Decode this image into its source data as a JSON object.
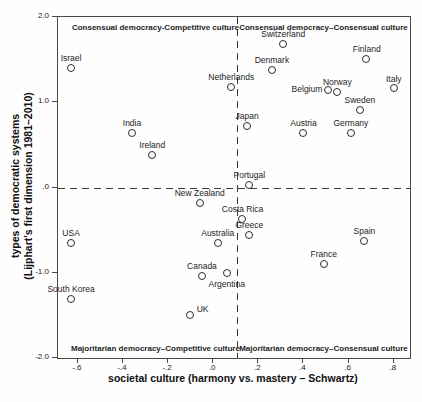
{
  "chart_data": {
    "type": "scatter",
    "title": "",
    "xlabel": "societal culture (harmony vs. mastery – Schwartz)",
    "ylabel_line1": "types of democratic systems",
    "ylabel_line2": "(Lijphart's first dimension 1981–2010)",
    "xlim": [
      -0.688,
      0.872
    ],
    "ylim": [
      -2.0,
      2.0
    ],
    "grid": false,
    "x_ticks": [
      {
        "value": -0.6,
        "label": "-.6"
      },
      {
        "value": -0.4,
        "label": "-.4"
      },
      {
        "value": -0.2,
        "label": "-.2"
      },
      {
        "value": 0.0,
        "label": ".0"
      },
      {
        "value": 0.2,
        "label": ".2"
      },
      {
        "value": 0.4,
        "label": ".4"
      },
      {
        "value": 0.6,
        "label": ".6"
      },
      {
        "value": 0.8,
        "label": ".8"
      }
    ],
    "y_ticks": [
      {
        "value": 2.0,
        "label": "2.0"
      },
      {
        "value": 1.0,
        "label": "1.0"
      },
      {
        "value": 0.0,
        "label": ".0"
      },
      {
        "value": -1.0,
        "label": "-1.0"
      },
      {
        "value": -2.0,
        "label": "-2.0"
      }
    ],
    "reference_lines": {
      "horizontal_y": 0.0,
      "vertical_x": 0.105,
      "style": "dashed",
      "color": "#3a3a3a"
    },
    "quadrant_labels": [
      {
        "id": "top-left",
        "text": "Consensual democracy-Competitive culture"
      },
      {
        "id": "top-right",
        "text": "Consensual democracy–Consensual culture"
      },
      {
        "id": "bottom-left",
        "text": "Majoritarian democracy–Competitive culture"
      },
      {
        "id": "bottom-right",
        "text": "Majoritarian democracy–Consensual culture"
      }
    ],
    "marker": {
      "shape": "open-circle",
      "color": "#2e2e2e",
      "size_px": 7
    },
    "colors": {
      "background": "#fefefe",
      "frame": "#4a4a4a",
      "text": "#1d1d1d"
    },
    "points": [
      {
        "country": "Israel",
        "x": -0.63,
        "y": 1.4,
        "label_pos": "above"
      },
      {
        "country": "Switzerland",
        "x": 0.31,
        "y": 1.68,
        "label_pos": "above"
      },
      {
        "country": "Finland",
        "x": 0.68,
        "y": 1.51,
        "label_pos": "above"
      },
      {
        "country": "Denmark",
        "x": 0.26,
        "y": 1.38,
        "label_pos": "above"
      },
      {
        "country": "Netherlands",
        "x": 0.08,
        "y": 1.18,
        "label_pos": "above"
      },
      {
        "country": "Italy",
        "x": 0.8,
        "y": 1.16,
        "label_pos": "above"
      },
      {
        "country": "Belgium",
        "x": 0.51,
        "y": 1.14,
        "label_pos": "left"
      },
      {
        "country": "Norway",
        "x": 0.55,
        "y": 1.12,
        "label_pos": "above"
      },
      {
        "country": "Sweden",
        "x": 0.65,
        "y": 0.91,
        "label_pos": "above"
      },
      {
        "country": "Japan",
        "x": 0.15,
        "y": 0.72,
        "label_pos": "above"
      },
      {
        "country": "Austria",
        "x": 0.4,
        "y": 0.64,
        "label_pos": "above"
      },
      {
        "country": "Germany",
        "x": 0.61,
        "y": 0.64,
        "label_pos": "above"
      },
      {
        "country": "India",
        "x": -0.36,
        "y": 0.64,
        "label_pos": "above"
      },
      {
        "country": "Ireland",
        "x": -0.27,
        "y": 0.38,
        "label_pos": "above"
      },
      {
        "country": "Portugal",
        "x": 0.16,
        "y": 0.03,
        "label_pos": "above"
      },
      {
        "country": "New Zealand",
        "x": -0.06,
        "y": -0.18,
        "label_pos": "above"
      },
      {
        "country": "Costa Rica",
        "x": 0.13,
        "y": -0.37,
        "label_pos": "above"
      },
      {
        "country": "Greece",
        "x": 0.16,
        "y": -0.56,
        "label_pos": "above"
      },
      {
        "country": "Australia",
        "x": 0.02,
        "y": -0.65,
        "label_pos": "above"
      },
      {
        "country": "USA",
        "x": -0.63,
        "y": -0.65,
        "label_pos": "above"
      },
      {
        "country": "Spain",
        "x": 0.67,
        "y": -0.63,
        "label_pos": "above"
      },
      {
        "country": "France",
        "x": 0.49,
        "y": -0.9,
        "label_pos": "above"
      },
      {
        "country": "Canada",
        "x": -0.05,
        "y": -1.04,
        "label_pos": "above"
      },
      {
        "country": "Argentina",
        "x": 0.06,
        "y": -1.01,
        "label_pos": "below"
      },
      {
        "country": "South Korea",
        "x": -0.63,
        "y": -1.31,
        "label_pos": "above"
      },
      {
        "country": "UK",
        "x": -0.1,
        "y": -1.5,
        "label_pos": "right"
      }
    ]
  }
}
